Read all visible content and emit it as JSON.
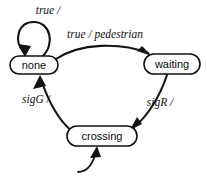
{
  "diagram": {
    "type": "state-machine",
    "background_color": "#ffffff",
    "line_color": "#141414",
    "text_color": "#0a0a0a",
    "states": [
      {
        "id": "none",
        "label": "none",
        "cx": 34,
        "cy": 65,
        "rx": 24,
        "ry": 9
      },
      {
        "id": "waiting",
        "label": "waiting",
        "cx": 172,
        "cy": 64,
        "rx": 28,
        "ry": 10
      },
      {
        "id": "crossing",
        "label": "crossing",
        "cx": 102,
        "cy": 136,
        "rx": 35,
        "ry": 10
      }
    ],
    "transitions": [
      {
        "id": "none-self",
        "from": "none",
        "to": "none",
        "label": "true /",
        "trigger": "true",
        "effect": "",
        "label_x": 48,
        "label_y": 10
      },
      {
        "id": "none-to-waiting",
        "from": "none",
        "to": "waiting",
        "label": "true / pedestrian",
        "trigger": "true",
        "effect": "pedestrian",
        "label_x": 105,
        "label_y": 35
      },
      {
        "id": "waiting-to-crossing",
        "from": "waiting",
        "to": "crossing",
        "label": "sigR /",
        "trigger": "sigR",
        "effect": "",
        "label_x": 160,
        "label_y": 103
      },
      {
        "id": "crossing-to-none",
        "from": "crossing",
        "to": "none",
        "label": "sigG /",
        "trigger": "sigG",
        "effect": "",
        "label_x": 36,
        "label_y": 100
      },
      {
        "id": "incoming-to-crossing",
        "from": "",
        "to": "crossing",
        "label": "",
        "trigger": "",
        "effect": "",
        "label_x": 0,
        "label_y": 0
      }
    ]
  }
}
